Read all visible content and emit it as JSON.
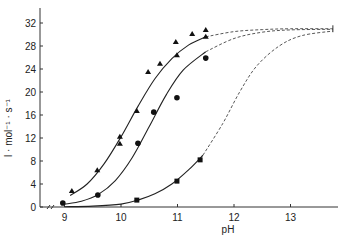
{
  "chart_data": {
    "type": "scatter",
    "title": "",
    "xlabel": "pH",
    "ylabel": "l · mol⁻¹ · s⁻¹",
    "xlim": [
      8.8,
      13.8
    ],
    "ylim": [
      0,
      33
    ],
    "x_ticks": [
      9,
      10,
      11,
      12,
      13
    ],
    "y_ticks": [
      0,
      4,
      8,
      12,
      16,
      20,
      24,
      28,
      32
    ],
    "grid": false,
    "legend": null,
    "axis_break": "x-axis break between 0 and 9",
    "plateau": {
      "value": 31,
      "pH": 13.75,
      "error_bar": [
        30.4,
        31.6
      ]
    },
    "series": [
      {
        "name": "triangles",
        "marker": "triangle",
        "points": [
          [
            9.13,
            2.8
          ],
          [
            9.58,
            6.4
          ],
          [
            9.98,
            12.2
          ],
          [
            9.98,
            11.0
          ],
          [
            10.28,
            16.7
          ],
          [
            10.48,
            23.5
          ],
          [
            10.69,
            24.9
          ],
          [
            10.99,
            26.4
          ],
          [
            10.97,
            28.7
          ],
          [
            11.26,
            30.1
          ],
          [
            11.5,
            30.8
          ],
          [
            11.5,
            29.6
          ]
        ],
        "fit_solid": [
          [
            9.1,
            2.0
          ],
          [
            9.4,
            4.0
          ],
          [
            9.7,
            7.5
          ],
          [
            10.0,
            12.2
          ],
          [
            10.3,
            17.5
          ],
          [
            10.6,
            22.3
          ],
          [
            10.9,
            25.8
          ],
          [
            11.2,
            28.2
          ],
          [
            11.5,
            29.6
          ]
        ],
        "fit_dashed": [
          [
            11.5,
            29.6
          ],
          [
            12.0,
            30.5
          ],
          [
            12.5,
            30.85
          ],
          [
            13.0,
            31.0
          ],
          [
            13.75,
            31.0
          ]
        ]
      },
      {
        "name": "circles",
        "marker": "circle",
        "points": [
          [
            8.97,
            0.7
          ],
          [
            9.59,
            2.1
          ],
          [
            10.3,
            11.1
          ],
          [
            10.58,
            16.5
          ],
          [
            10.99,
            19.0
          ],
          [
            11.5,
            25.9
          ]
        ],
        "fit_solid": [
          [
            9.0,
            0.5
          ],
          [
            9.3,
            1.0
          ],
          [
            9.6,
            2.2
          ],
          [
            9.9,
            4.6
          ],
          [
            10.2,
            8.6
          ],
          [
            10.5,
            14.0
          ],
          [
            10.8,
            19.5
          ],
          [
            11.1,
            23.8
          ],
          [
            11.5,
            27.0
          ]
        ],
        "fit_dashed": [
          [
            11.5,
            27.0
          ],
          [
            12.0,
            29.3
          ],
          [
            12.5,
            30.4
          ],
          [
            13.0,
            30.8
          ],
          [
            13.75,
            30.9
          ]
        ]
      },
      {
        "name": "squares",
        "marker": "square",
        "points": [
          [
            10.28,
            1.2
          ],
          [
            10.99,
            4.5
          ],
          [
            11.4,
            8.2
          ]
        ],
        "fit_solid": [
          [
            9.0,
            0.05
          ],
          [
            9.5,
            0.15
          ],
          [
            10.0,
            0.5
          ],
          [
            10.3,
            1.2
          ],
          [
            10.6,
            2.3
          ],
          [
            10.9,
            4.0
          ],
          [
            11.2,
            6.5
          ],
          [
            11.45,
            9.0
          ]
        ],
        "fit_dashed": [
          [
            11.45,
            9.0
          ],
          [
            11.8,
            14.5
          ],
          [
            12.1,
            20.0
          ],
          [
            12.4,
            24.5
          ],
          [
            12.8,
            28.0
          ],
          [
            13.2,
            29.8
          ],
          [
            13.75,
            30.6
          ]
        ]
      }
    ]
  }
}
